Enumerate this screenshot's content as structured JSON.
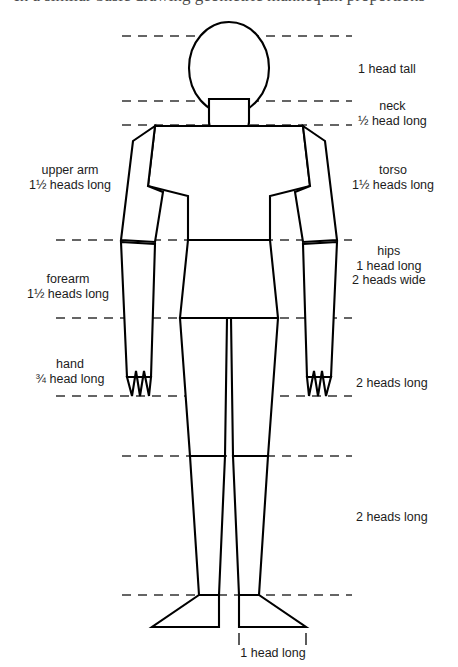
{
  "page": {
    "running_title": "In a similar basic drawing geometric mannequin proportions"
  },
  "diagram": {
    "figure_name": "mannequin-figure",
    "stroke_color": "#000000",
    "fill_color": "#ffffff",
    "guide_color": "#333333"
  },
  "labels": {
    "right": [
      {
        "name": "head-height",
        "lines": [
          "1 head tall"
        ]
      },
      {
        "name": "neck",
        "lines": [
          "neck",
          "½ head long"
        ]
      },
      {
        "name": "torso",
        "lines": [
          "torso",
          "1½ heads long"
        ]
      },
      {
        "name": "hips",
        "lines": [
          "hips",
          "1 head long",
          "2 heads wide"
        ]
      },
      {
        "name": "upper-leg",
        "lines": [
          "2 heads long"
        ]
      },
      {
        "name": "lower-leg",
        "lines": [
          "2 heads long"
        ]
      }
    ],
    "left": [
      {
        "name": "upper-arm",
        "lines": [
          "upper arm",
          "1½ heads long"
        ]
      },
      {
        "name": "forearm",
        "lines": [
          "forearm",
          "1½ heads long"
        ]
      },
      {
        "name": "hand",
        "lines": [
          "hand",
          "¾ head long"
        ]
      }
    ],
    "bottom": [
      {
        "name": "foot-length",
        "lines": [
          "1 head long"
        ]
      }
    ]
  },
  "guides": {
    "description": "Dashed horizontal measurement lines",
    "count": 8
  }
}
